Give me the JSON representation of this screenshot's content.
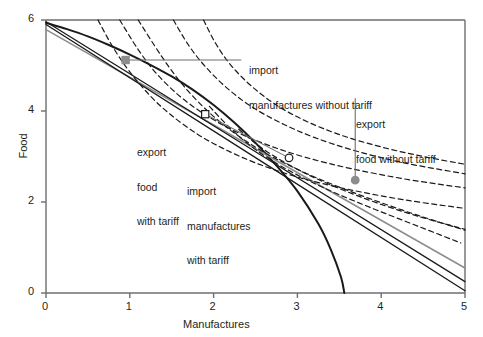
{
  "chart_data": {
    "type": "line",
    "title": "",
    "xlabel": "Manufactures",
    "ylabel": "Food",
    "xlim": [
      0,
      5
    ],
    "ylim": [
      0,
      6
    ],
    "xticks": [
      0,
      1,
      2,
      3,
      4,
      5
    ],
    "yticks": [
      0,
      2,
      4,
      6
    ],
    "xticklabels": [
      "0",
      "1",
      "2",
      "3",
      "4",
      "5"
    ],
    "yticklabels": [
      "0",
      "2",
      "4",
      "6"
    ],
    "grid": false,
    "legend": "none",
    "series": [
      {
        "name": "production-possibility-frontier",
        "style": "solid",
        "color": "#1a1a1a",
        "width": 2.0,
        "points": [
          [
            0.0,
            5.94
          ],
          [
            0.25,
            5.8
          ],
          [
            0.5,
            5.64
          ],
          [
            0.75,
            5.45
          ],
          [
            1.0,
            5.24
          ],
          [
            1.25,
            5.01
          ],
          [
            1.5,
            4.76
          ],
          [
            1.75,
            4.47
          ],
          [
            2.0,
            4.13
          ],
          [
            2.25,
            3.74
          ],
          [
            2.5,
            3.3
          ],
          [
            2.75,
            2.8
          ],
          [
            3.0,
            2.24
          ],
          [
            3.25,
            1.52
          ],
          [
            3.4,
            0.95
          ],
          [
            3.52,
            0.35
          ],
          [
            3.56,
            0.0
          ]
        ]
      },
      {
        "name": "world-price-line-no-tariff",
        "style": "solid",
        "color": "#8c8c8c",
        "width": 1.5,
        "points": [
          [
            0.0,
            5.79
          ],
          [
            5.0,
            0.55
          ]
        ]
      },
      {
        "name": "budget-line-with-tariff",
        "style": "solid",
        "color": "#1a1a1a",
        "width": 1.3,
        "points": [
          [
            0.0,
            5.96
          ],
          [
            5.0,
            0.25
          ]
        ]
      },
      {
        "name": "domestic-price-line-with-tariff",
        "style": "solid",
        "color": "#1a1a1a",
        "width": 1.3,
        "points": [
          [
            0.0,
            5.9
          ],
          [
            5.0,
            0.05
          ]
        ]
      },
      {
        "name": "indifference-curve-1",
        "style": "dashed",
        "color": "#1a1a1a",
        "width": 1.2,
        "points": [
          [
            0.62,
            6.0
          ],
          [
            0.8,
            5.4
          ],
          [
            1.0,
            4.86
          ],
          [
            1.25,
            4.32
          ],
          [
            1.5,
            3.9
          ],
          [
            1.8,
            3.5
          ],
          [
            2.1,
            3.19
          ],
          [
            2.5,
            2.86
          ],
          [
            3.0,
            2.55
          ],
          [
            3.6,
            2.28
          ],
          [
            4.3,
            2.04
          ],
          [
            5.0,
            1.86
          ]
        ]
      },
      {
        "name": "indifference-curve-2",
        "style": "dashed",
        "color": "#1a1a1a",
        "width": 1.2,
        "points": [
          [
            0.88,
            6.0
          ],
          [
            1.1,
            5.35
          ],
          [
            1.32,
            4.82
          ],
          [
            1.6,
            4.32
          ],
          [
            1.9,
            3.92
          ],
          [
            2.25,
            3.56
          ],
          [
            2.65,
            3.25
          ],
          [
            3.1,
            2.98
          ],
          [
            3.65,
            2.73
          ],
          [
            4.3,
            2.5
          ],
          [
            5.0,
            2.31
          ]
        ]
      },
      {
        "name": "indifference-curve-3",
        "style": "dashed",
        "color": "#1a1a1a",
        "width": 1.2,
        "points": [
          [
            1.52,
            6.0
          ],
          [
            1.7,
            5.45
          ],
          [
            1.9,
            4.98
          ],
          [
            2.15,
            4.52
          ],
          [
            2.45,
            4.1
          ],
          [
            2.8,
            3.74
          ],
          [
            3.2,
            3.42
          ],
          [
            3.7,
            3.12
          ],
          [
            4.3,
            2.85
          ],
          [
            5.0,
            2.62
          ]
        ]
      },
      {
        "name": "indifference-curve-4",
        "style": "dashed",
        "color": "#1a1a1a",
        "width": 1.2,
        "points": [
          [
            1.88,
            6.0
          ],
          [
            2.02,
            5.5
          ],
          [
            2.2,
            5.02
          ],
          [
            2.45,
            4.55
          ],
          [
            2.75,
            4.13
          ],
          [
            3.1,
            3.78
          ],
          [
            3.52,
            3.47
          ],
          [
            4.0,
            3.21
          ],
          [
            4.5,
            3.0
          ],
          [
            5.0,
            2.83
          ]
        ]
      },
      {
        "name": "indifference-curve-lower-a",
        "style": "dashed",
        "color": "#1a1a1a",
        "width": 1.2,
        "points": [
          [
            1.1,
            6.0
          ],
          [
            1.38,
            5.2
          ],
          [
            1.62,
            4.6
          ],
          [
            1.9,
            4.05
          ],
          [
            2.2,
            3.58
          ],
          [
            2.55,
            3.15
          ],
          [
            2.95,
            2.76
          ],
          [
            3.4,
            2.4
          ],
          [
            3.9,
            2.05
          ],
          [
            4.45,
            1.7
          ],
          [
            5.0,
            1.38
          ]
        ]
      },
      {
        "name": "indifference-curve-lower-b",
        "style": "dashed",
        "color": "#1a1a1a",
        "width": 1.2,
        "points": [
          [
            1.95,
            4.1
          ],
          [
            2.2,
            3.62
          ],
          [
            2.45,
            3.22
          ],
          [
            2.75,
            2.85
          ],
          [
            3.1,
            2.5
          ],
          [
            3.5,
            2.16
          ],
          [
            3.95,
            1.82
          ],
          [
            4.45,
            1.46
          ],
          [
            4.95,
            1.1
          ]
        ]
      },
      {
        "name": "indifference-curve-lower-c",
        "style": "dashed",
        "color": "#1a1a1a",
        "width": 1.2,
        "points": [
          [
            2.3,
            3.6
          ],
          [
            2.55,
            3.22
          ],
          [
            2.82,
            2.9
          ],
          [
            3.15,
            2.58
          ],
          [
            3.52,
            2.28
          ],
          [
            3.95,
            1.98
          ],
          [
            4.45,
            1.68
          ],
          [
            5.0,
            1.4
          ]
        ]
      }
    ],
    "markers": [
      {
        "name": "export-food-without-tariff-production",
        "x": 0.95,
        "y": 5.12,
        "shape": "square",
        "fill": "#8c8c8c",
        "stroke": "#8c8c8c"
      },
      {
        "name": "export-food-with-tariff-production",
        "x": 1.9,
        "y": 3.93,
        "shape": "square",
        "fill": "#ffffff",
        "stroke": "#1a1a1a"
      },
      {
        "name": "import-manufactures-with-tariff-consumption",
        "x": 2.9,
        "y": 2.97,
        "shape": "circle",
        "fill": "#ffffff",
        "stroke": "#1a1a1a"
      },
      {
        "name": "import-manufactures-without-tariff-consumption",
        "x": 3.69,
        "y": 2.48,
        "shape": "circle",
        "fill": "#8c8c8c",
        "stroke": "#8c8c8c"
      }
    ],
    "annotations": [
      {
        "name": "import-manufactures-without-tariff",
        "line1": "import",
        "line2": "manufactures without tariff",
        "leader": {
          "from": [
            0.95,
            5.12
          ],
          "to": [
            2.33,
            5.12
          ]
        }
      },
      {
        "name": "export-food-without-tariff",
        "line1": "export",
        "line2": "food without tariff",
        "leader": {
          "from": [
            3.69,
            2.48
          ],
          "to": [
            3.69,
            4.28
          ]
        }
      },
      {
        "name": "export-food-with-tariff",
        "line1": "export",
        "line2": "food",
        "line3": "with tariff",
        "leader": null
      },
      {
        "name": "import-manufactures-with-tariff",
        "line1": "import",
        "line2": "manufactures",
        "line3": "with tariff",
        "leader": {
          "from": [
            1.9,
            3.93
          ],
          "to": [
            2.9,
            2.97
          ]
        }
      }
    ]
  },
  "axes": {
    "x_title": "Manufactures",
    "y_title": "Food",
    "x_ticks": [
      "0",
      "1",
      "2",
      "3",
      "4",
      "5"
    ],
    "y_ticks": [
      "0",
      "2",
      "4",
      "6"
    ]
  },
  "labels": {
    "import_no_tariff_l1": "import",
    "import_no_tariff_l2": "manufactures without tariff",
    "export_no_tariff_l1": "export",
    "export_no_tariff_l2": "food without tariff",
    "export_tariff_l1": "export",
    "export_tariff_l2": "food",
    "export_tariff_l3": "with tariff",
    "import_tariff_l1": "import",
    "import_tariff_l2": "manufactures",
    "import_tariff_l3": "with tariff"
  },
  "colors": {
    "axis": "#6d6e71",
    "curve": "#1a1a1a",
    "world_price": "#8c8c8c",
    "marker_gray": "#8c8c8c",
    "text": "#231f20",
    "background": "#ffffff"
  }
}
